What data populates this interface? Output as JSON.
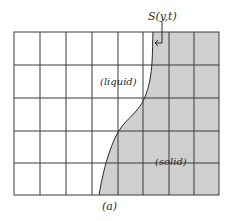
{
  "diagram": {
    "interface_label": "S(y,t)",
    "liquid_label": "(liquid)",
    "solid_label": "(solid)",
    "caption": "(a)",
    "grid": {
      "columns": 8,
      "rows": 5
    },
    "colors": {
      "solid_fill": "#cfcfcf",
      "grid_line": "#3a3a3a",
      "background": "#ffffff"
    }
  }
}
